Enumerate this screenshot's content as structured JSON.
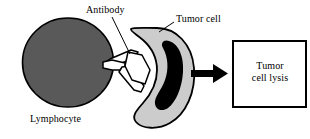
{
  "figure": {
    "background_color": "#ffffff"
  },
  "labels": {
    "antibody": "Antibody",
    "tumor_cell": "Tumor cell",
    "lymphocyte": "Lymphocyte"
  },
  "outcome_box": {
    "line1": "Tumor",
    "line2": "cell lysis",
    "border_color": "#000000",
    "fill_color": "#ffffff"
  },
  "shapes": {
    "lymphocyte": {
      "name": "lymphocyte-cell",
      "fill_color": "#595959",
      "stroke_color": "#000000"
    },
    "tumor_cell": {
      "name": "tumor-cell",
      "fill_color": "#cccccc",
      "stroke_color": "#000000"
    },
    "tumor_nucleus": {
      "name": "tumor-cell-nucleus",
      "fill_color": "#000000"
    },
    "antibody": {
      "name": "antibody-bridge",
      "fill_color": "#ffffff",
      "stroke_color": "#000000",
      "count": 2
    },
    "arrow": {
      "name": "process-arrow",
      "fill_color": "#000000",
      "direction": "right"
    },
    "leader_lines": {
      "stroke_color": "#000000"
    }
  }
}
